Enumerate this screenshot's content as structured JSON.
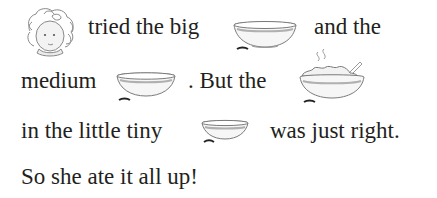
{
  "page": {
    "lines": [
      {
        "segments": [
          {
            "type": "icon",
            "name": "goldilocks-face"
          },
          {
            "type": "text",
            "value": "tried the big"
          },
          {
            "type": "icon",
            "name": "big-bowl"
          },
          {
            "type": "text",
            "value": "and the"
          }
        ]
      },
      {
        "segments": [
          {
            "type": "text",
            "value": "medium"
          },
          {
            "type": "icon",
            "name": "medium-bowl"
          },
          {
            "type": "text",
            "value": ". But the"
          },
          {
            "type": "icon",
            "name": "porridge-bowl"
          }
        ]
      },
      {
        "segments": [
          {
            "type": "text",
            "value": "in the little tiny"
          },
          {
            "type": "icon",
            "name": "small-bowl"
          },
          {
            "type": "text",
            "value": "was just right."
          }
        ]
      },
      {
        "segments": [
          {
            "type": "text",
            "value": "So she ate it all up!"
          }
        ]
      }
    ],
    "text": {
      "l1a": "tried the big",
      "l1b": "and the",
      "l2a": "medium",
      "l2b": ". But the",
      "l3a": "in the little tiny",
      "l3b": "was just right.",
      "l4": "So she ate it all up!"
    }
  }
}
